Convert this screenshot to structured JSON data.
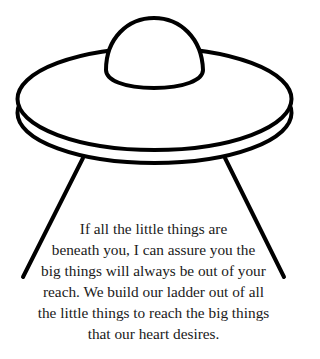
{
  "illustration": {
    "subject": "ufo-flying-saucer",
    "stroke_color": "#000000",
    "fill_color": "#ffffff"
  },
  "quote": {
    "lines": [
      "If all the little things are",
      "beneath you, I can assure you the",
      "big things will always be out of your",
      "reach. We build our ladder out of all",
      "the little things to reach the big things",
      "that our heart desires."
    ],
    "text_color": "#1a1a1a"
  }
}
